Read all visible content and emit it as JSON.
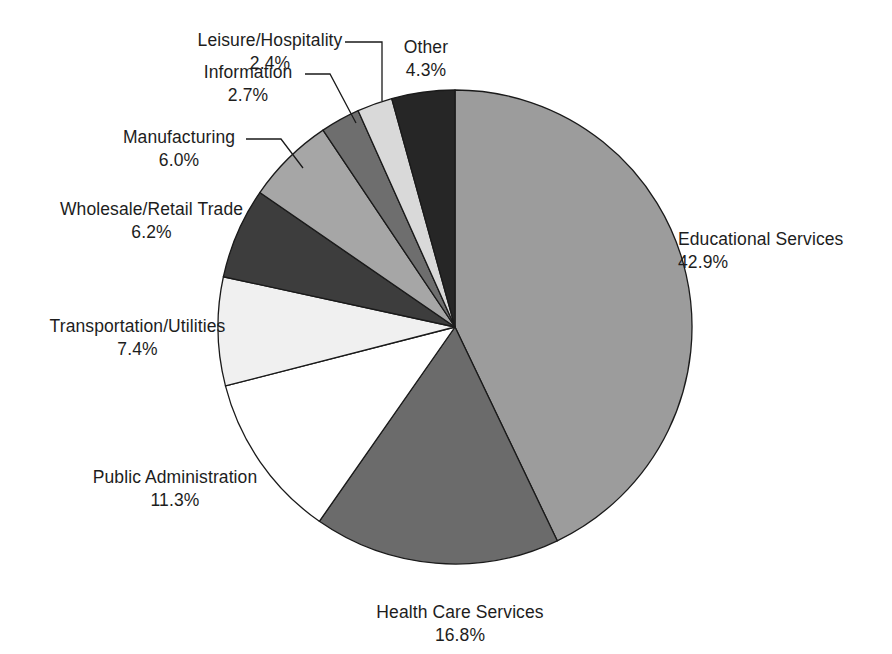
{
  "chart_data": {
    "type": "pie",
    "title": "",
    "subtitle": "",
    "xlabel": "",
    "ylabel": "",
    "legend_position": "outside-labels-with-leader-lines",
    "grid": false,
    "start_angle_deg": 0,
    "direction": "clockwise",
    "value_unit": "percent",
    "categories": [
      "Educational Services",
      "Health Care Services",
      "Public Administration",
      "Transportation/Utilities",
      "Wholesale/Retail Trade",
      "Manufacturing",
      "Information",
      "Leisure/Hospitality",
      "Other"
    ],
    "values": [
      42.9,
      16.8,
      11.3,
      7.4,
      6.2,
      6.0,
      2.7,
      2.4,
      4.3
    ],
    "colors": [
      "#9c9c9c",
      "#6b6b6b",
      "#ffffff",
      "#f0f0f0",
      "#3d3d3d",
      "#a6a6a6",
      "#6e6e6e",
      "#d9d9d9",
      "#262626"
    ],
    "slices": [
      {
        "label": "Educational Services",
        "value": 42.9,
        "display": "42.9%",
        "color": "#9c9c9c"
      },
      {
        "label": "Health Care Services",
        "value": 16.8,
        "display": "16.8%",
        "color": "#6b6b6b"
      },
      {
        "label": "Public Administration",
        "value": 11.3,
        "display": "11.3%",
        "color": "#ffffff"
      },
      {
        "label": "Transportation/Utilities",
        "value": 7.4,
        "display": "7.4%",
        "color": "#f0f0f0"
      },
      {
        "label": "Wholesale/Retail Trade",
        "value": 6.2,
        "display": "6.2%",
        "color": "#3d3d3d"
      },
      {
        "label": "Manufacturing",
        "value": 6.0,
        "display": "6.0%",
        "color": "#a6a6a6"
      },
      {
        "label": "Information",
        "value": 2.7,
        "display": "2.7%",
        "color": "#6e6e6e"
      },
      {
        "label": "Leisure/Hospitality",
        "value": 2.4,
        "display": "2.4%",
        "color": "#d9d9d9"
      },
      {
        "label": "Other",
        "value": 4.3,
        "display": "4.3%",
        "color": "#262626"
      }
    ]
  },
  "labels": {
    "educational_services": {
      "name": "Educational Services",
      "pct": "42.9%"
    },
    "health_care_services": {
      "name": "Health Care Services",
      "pct": "16.8%"
    },
    "public_administration": {
      "name": "Public Administration",
      "pct": "11.3%"
    },
    "transportation_utilities": {
      "name": "Transportation/Utilities",
      "pct": "7.4%"
    },
    "wholesale_retail_trade": {
      "name": "Wholesale/Retail Trade",
      "pct": "6.2%"
    },
    "manufacturing": {
      "name": "Manufacturing",
      "pct": "6.0%"
    },
    "information": {
      "name": "Information",
      "pct": "2.7%"
    },
    "leisure_hospitality": {
      "name": "Leisure/Hospitality",
      "pct": "2.4%"
    },
    "other": {
      "name": "Other",
      "pct": "4.3%"
    }
  },
  "style": {
    "outline_color": "#1a1a1a",
    "leader_color": "#1a1a1a",
    "background": "#ffffff",
    "text_color": "#1d1d1d"
  }
}
